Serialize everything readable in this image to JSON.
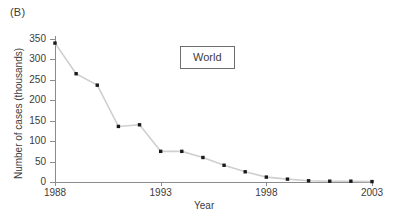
{
  "panel": {
    "label": "(B)"
  },
  "annotation": {
    "text": "World"
  },
  "chart_data": {
    "type": "line",
    "title": "",
    "subtitle": "",
    "xlabel": "Year",
    "ylabel": "Number of cases (thousands)",
    "xlim": [
      1988,
      2003
    ],
    "ylim": [
      0,
      350
    ],
    "xticks": [
      1988,
      1993,
      1998,
      2003
    ],
    "xtick_labels": [
      "1988",
      "1993",
      "1998",
      "2003"
    ],
    "yticks": [
      0,
      50,
      100,
      150,
      200,
      250,
      300,
      350
    ],
    "ytick_labels": [
      "0",
      "50",
      "100",
      "150",
      "200",
      "250",
      "300",
      "350"
    ],
    "grid": false,
    "legend": false,
    "legend_position": "none",
    "annotations": [
      {
        "text": "World",
        "x": 1994,
        "y": 300,
        "boxed": true
      }
    ],
    "series": [
      {
        "name": "World",
        "line_color": "#cfcfcf",
        "marker_color": "#1a1a1a",
        "x": [
          1988,
          1989,
          1990,
          1991,
          1992,
          1993,
          1994,
          1995,
          1996,
          1997,
          1998,
          1999,
          2000,
          2001,
          2002,
          2003
        ],
        "values": [
          340,
          265,
          237,
          136,
          140,
          75,
          75,
          60,
          41,
          25,
          12,
          7,
          3,
          2,
          2,
          1
        ]
      }
    ]
  }
}
